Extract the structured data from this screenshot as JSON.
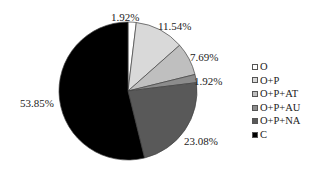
{
  "chart_data": {
    "type": "pie",
    "title": "",
    "categories": [
      "O",
      "O+P",
      "O+P+AT",
      "O+P+AU",
      "O+P+NA",
      "C"
    ],
    "values": [
      1.92,
      11.54,
      7.69,
      1.92,
      23.08,
      53.85
    ],
    "value_labels": [
      "1.92%",
      "11.54%",
      "7.69%",
      "1.92%",
      "23.08%",
      "53.85%"
    ],
    "colors": [
      "#ffffff",
      "#d9d9d9",
      "#bfbfbf",
      "#8c8c8c",
      "#595959",
      "#000000"
    ],
    "start_angle": "12 o'clock",
    "direction": "clockwise",
    "legend_position": "right"
  },
  "legend": {
    "items": [
      {
        "label": "O",
        "color": "#ffffff"
      },
      {
        "label": "O+P",
        "color": "#d9d9d9"
      },
      {
        "label": "O+P+AT",
        "color": "#bfbfbf"
      },
      {
        "label": "O+P+AU",
        "color": "#8c8c8c"
      },
      {
        "label": "O+P+NA",
        "color": "#595959"
      },
      {
        "label": "C",
        "color": "#000000"
      }
    ]
  }
}
